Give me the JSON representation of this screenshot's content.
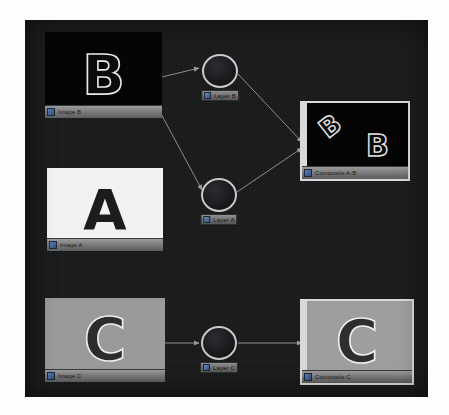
{
  "app": {
    "view_name": "node-graph",
    "canvas_background": "#17181a",
    "wire_color": "#8d8d8d",
    "selection_color": "#d9d9d9"
  },
  "nodes": {
    "source_b": {
      "label": "Image B",
      "glyph": "B",
      "icon": "node-thumbnail-icon",
      "bg_color": "#050505",
      "fg_color": "#0b0b0b",
      "outline_color": "#e8e8e8",
      "x": 20,
      "y": 12,
      "w": 117,
      "h": 86,
      "selected": false
    },
    "source_a": {
      "label": "Image A",
      "glyph": "A",
      "icon": "node-thumbnail-icon",
      "bg_color": "#f2f2f2",
      "fg_color": "#1c1c1c",
      "outline_color": "#1c1c1c",
      "x": 22,
      "y": 148,
      "w": 116,
      "h": 83,
      "selected": false
    },
    "source_c": {
      "label": "Image C",
      "glyph": "C",
      "icon": "node-thumbnail-icon",
      "bg_color": "#9a9a9a",
      "fg_color": "#2c2c2c",
      "outline_color": "#ededed",
      "x": 20,
      "y": 278,
      "w": 120,
      "h": 84,
      "selected": false
    },
    "layer_b": {
      "label": "Layer B",
      "icon": "operator-node-icon",
      "x": 177,
      "y": 34,
      "w": 36,
      "h": 34
    },
    "layer_a": {
      "label": "Layer A",
      "icon": "operator-node-icon",
      "x": 176,
      "y": 158,
      "w": 36,
      "h": 34
    },
    "layer_c": {
      "label": "Layer C",
      "icon": "operator-node-icon",
      "x": 176,
      "y": 306,
      "w": 36,
      "h": 34
    },
    "composite_ab": {
      "label": "Composite A-B",
      "glyph_rotated": "B",
      "glyph_upright": "B",
      "icon": "node-thumbnail-icon",
      "bg_color": "#040404",
      "fg_color": "#0a0a0a",
      "outline_color": "#e6e6e6",
      "x": 277,
      "y": 83,
      "w": 106,
      "h": 76,
      "selected": true
    },
    "composite_c": {
      "label": "Composite C",
      "glyph": "C",
      "icon": "node-thumbnail-icon",
      "bg_color": "#9e9e9e",
      "fg_color": "#2e2e2e",
      "outline_color": "#efefef",
      "x": 277,
      "y": 281,
      "w": 110,
      "h": 82,
      "selected": true
    }
  },
  "connections": [
    {
      "name": "image-b-to-layer-b",
      "from": "source_b",
      "to": "layer_b"
    },
    {
      "name": "image-b-to-layer-a",
      "from": "source_b",
      "to": "layer_a"
    },
    {
      "name": "layer-b-to-composite-ab",
      "from": "layer_b",
      "to": "composite_ab"
    },
    {
      "name": "layer-a-to-composite-ab",
      "from": "layer_a",
      "to": "composite_ab"
    },
    {
      "name": "image-c-to-layer-c",
      "from": "source_c",
      "to": "layer_c"
    },
    {
      "name": "layer-c-to-composite-c",
      "from": "layer_c",
      "to": "composite_c"
    }
  ]
}
